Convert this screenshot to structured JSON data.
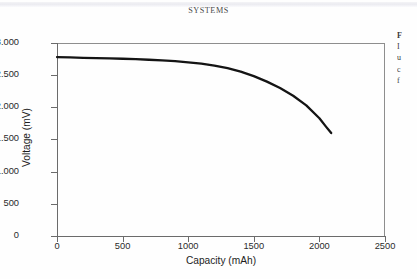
{
  "running_head": "SYSTEMS",
  "figure": {
    "xlabel": "Capacity (mAh)",
    "ylabel": "Voltage (mV)",
    "xticks": [
      "0",
      "500",
      "1000",
      "1500",
      "2000",
      "2500"
    ],
    "yticks": [
      "0",
      "500",
      "1.000",
      "1.500",
      "2.000",
      "2.500",
      "3.000"
    ]
  },
  "caption_column": {
    "lines": [
      "F",
      "I",
      "u",
      "c",
      "f"
    ]
  },
  "colors": {
    "curve": "#141414",
    "axis": "#6b6b6b",
    "frame": "#8e8e8e",
    "text": "#1d1d1d",
    "page": "#fefefe"
  },
  "chart_data": {
    "type": "line",
    "title": "",
    "xlabel": "Capacity (mAh)",
    "ylabel": "Voltage (mV)",
    "xlim": [
      0,
      2500
    ],
    "ylim": [
      0,
      3000
    ],
    "xticks": [
      0,
      500,
      1000,
      1500,
      2000,
      2500
    ],
    "yticks": [
      0,
      500,
      1000,
      1500,
      2000,
      2500,
      3000
    ],
    "grid": false,
    "legend": null,
    "series": [
      {
        "name": "Discharge curve",
        "color": "#141414",
        "x": [
          0,
          100,
          200,
          300,
          400,
          500,
          600,
          700,
          800,
          900,
          1000,
          1100,
          1200,
          1300,
          1400,
          1500,
          1600,
          1700,
          1800,
          1900,
          2000,
          2050,
          2090
        ],
        "y": [
          2780,
          2775,
          2770,
          2765,
          2760,
          2755,
          2748,
          2740,
          2730,
          2718,
          2700,
          2678,
          2650,
          2610,
          2555,
          2485,
          2400,
          2300,
          2180,
          2030,
          1830,
          1700,
          1600
        ]
      }
    ]
  }
}
